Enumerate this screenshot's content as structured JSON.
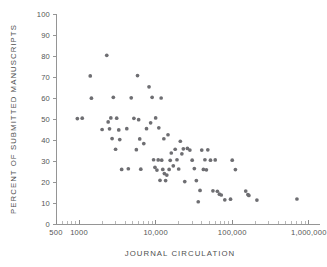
{
  "chart_data": {
    "type": "scatter",
    "title": "",
    "xlabel": "JOURNAL CIRCULATION",
    "ylabel": "PERCENT OF SUBMITTED MANUSCRIPTS",
    "xscale": "log",
    "yscale": "linear",
    "xlim": [
      500,
      1400000
    ],
    "ylim": [
      0,
      100
    ],
    "grid": false,
    "legend": null,
    "marker_color": "#6e6e72",
    "axis_color": "#8a8a8a",
    "x_tick_labels": [
      "500",
      "1000",
      "10,000",
      "100,000",
      "1,000,000"
    ],
    "x_tick_values": [
      500,
      1000,
      10000,
      100000,
      1000000
    ],
    "y_tick_labels": [
      "0",
      "10",
      "20",
      "30",
      "40",
      "50",
      "60",
      "70",
      "80",
      "90",
      "100"
    ],
    "y_tick_values": [
      0,
      10,
      20,
      30,
      40,
      50,
      60,
      70,
      80,
      90,
      100
    ],
    "x": [
      950,
      1100,
      1400,
      1450,
      2300,
      2000,
      2400,
      2600,
      2500,
      2700,
      2800,
      3000,
      3100,
      3300,
      3400,
      3600,
      4200,
      4400,
      4800,
      5200,
      5600,
      5800,
      6000,
      6200,
      6400,
      7000,
      7600,
      8200,
      8600,
      9000,
      9400,
      9800,
      10000,
      10400,
      10800,
      11000,
      11400,
      11800,
      12000,
      12400,
      12800,
      13000,
      13500,
      14000,
      14500,
      15000,
      15500,
      16000,
      17000,
      18000,
      19000,
      20000,
      21000,
      22000,
      23000,
      24000,
      26000,
      28000,
      30000,
      32000,
      34000,
      36000,
      38000,
      40000,
      42000,
      44000,
      46000,
      48000,
      52000,
      56000,
      60000,
      64000,
      68000,
      72000,
      80000,
      95000,
      100000,
      110000,
      150000,
      160000,
      165000,
      210000,
      700000
    ],
    "y": [
      50.2,
      50.4,
      70.5,
      59.9,
      80.3,
      45.0,
      48.6,
      50.5,
      45.3,
      40.7,
      60.3,
      35.6,
      50.4,
      44.8,
      40.2,
      26.0,
      45.4,
      26.3,
      60.1,
      50.3,
      35.4,
      70.7,
      49.7,
      40.5,
      26.1,
      38.3,
      45.4,
      65.3,
      48.2,
      60.3,
      30.6,
      27.0,
      50.5,
      25.7,
      30.5,
      45.8,
      20.8,
      60.0,
      30.4,
      26.0,
      40.6,
      24.0,
      20.7,
      23.3,
      42.5,
      26.0,
      30.3,
      33.8,
      27.7,
      35.6,
      30.6,
      26.2,
      39.4,
      33.4,
      35.8,
      20.2,
      36.0,
      35.2,
      30.4,
      26.4,
      20.7,
      10.6,
      16.0,
      35.2,
      26.0,
      30.6,
      25.8,
      35.3,
      30.4,
      15.8,
      30.5,
      15.6,
      14.2,
      13.8,
      11.5,
      11.8,
      30.4,
      25.9,
      15.7,
      14.0,
      13.6,
      11.4,
      11.9
    ]
  }
}
